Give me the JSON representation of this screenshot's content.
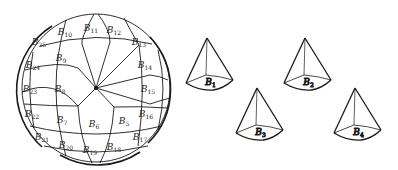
{
  "figure": {
    "stroke_color": "#1a1a1a",
    "background": "#ffffff"
  },
  "sphere": {
    "patch_labels": [
      {
        "id": "B5",
        "base": "B",
        "sub": "5",
        "x": 124,
        "y": 124
      },
      {
        "id": "B6",
        "base": "B",
        "sub": "6",
        "x": 94,
        "y": 127
      },
      {
        "id": "B7",
        "base": "B",
        "sub": "7",
        "x": 62,
        "y": 123
      },
      {
        "id": "B8",
        "base": "B",
        "sub": "8",
        "x": 60,
        "y": 92
      },
      {
        "id": "B9",
        "base": "B",
        "sub": "9",
        "x": 61,
        "y": 61
      },
      {
        "id": "B10",
        "base": "B",
        "sub": "10",
        "x": 65,
        "y": 35
      },
      {
        "id": "B11",
        "base": "B",
        "sub": "11",
        "x": 91,
        "y": 31
      },
      {
        "id": "B12",
        "base": "B",
        "sub": "12",
        "x": 114,
        "y": 33
      },
      {
        "id": "B13",
        "base": "B",
        "sub": "13",
        "x": 139,
        "y": 45
      },
      {
        "id": "B14",
        "base": "B",
        "sub": "14",
        "x": 145,
        "y": 68
      },
      {
        "id": "B15",
        "base": "B",
        "sub": "15",
        "x": 148,
        "y": 92
      },
      {
        "id": "B16",
        "base": "B",
        "sub": "16",
        "x": 146,
        "y": 117
      },
      {
        "id": "B17",
        "base": "B",
        "sub": "17",
        "x": 140,
        "y": 140
      },
      {
        "id": "B18",
        "base": "B",
        "sub": "18",
        "x": 114,
        "y": 150
      },
      {
        "id": "B19",
        "base": "B",
        "sub": "19",
        "x": 90,
        "y": 153
      },
      {
        "id": "B20",
        "base": "B",
        "sub": "20",
        "x": 66,
        "y": 148
      },
      {
        "id": "B21",
        "base": "B",
        "sub": "21",
        "x": 42,
        "y": 140
      },
      {
        "id": "B22",
        "base": "B",
        "sub": "22",
        "x": 32,
        "y": 117
      },
      {
        "id": "B23",
        "base": "B",
        "sub": "23",
        "x": 30,
        "y": 92
      },
      {
        "id": "B24",
        "base": "B",
        "sub": "24",
        "x": 33,
        "y": 68
      },
      {
        "id": "B25",
        "base": "B",
        "sub": "25",
        "x": 39,
        "y": 45
      }
    ]
  },
  "cones": [
    {
      "id": "cone-B1",
      "label_base": "B",
      "label_sub": "1",
      "apex": [
        207,
        38
      ],
      "base_left": [
        186,
        83
      ],
      "base_back": [
        206,
        75
      ],
      "base_right": [
        233,
        80
      ],
      "base_front": [
        213,
        89
      ]
    },
    {
      "id": "cone-B2",
      "label_base": "B",
      "label_sub": "2",
      "apex": [
        305,
        38
      ],
      "base_left": [
        284,
        83
      ],
      "base_back": [
        304,
        75
      ],
      "base_right": [
        331,
        80
      ],
      "base_front": [
        311,
        89
      ]
    },
    {
      "id": "cone-B3",
      "label_base": "B",
      "label_sub": "3",
      "apex": [
        257,
        88
      ],
      "base_left": [
        236,
        133
      ],
      "base_back": [
        256,
        125
      ],
      "base_right": [
        283,
        130
      ],
      "base_front": [
        263,
        139
      ]
    },
    {
      "id": "cone-B4",
      "label_base": "B",
      "label_sub": "4",
      "apex": [
        355,
        88
      ],
      "base_left": [
        334,
        133
      ],
      "base_back": [
        354,
        125
      ],
      "base_right": [
        381,
        130
      ],
      "base_front": [
        361,
        139
      ]
    }
  ]
}
